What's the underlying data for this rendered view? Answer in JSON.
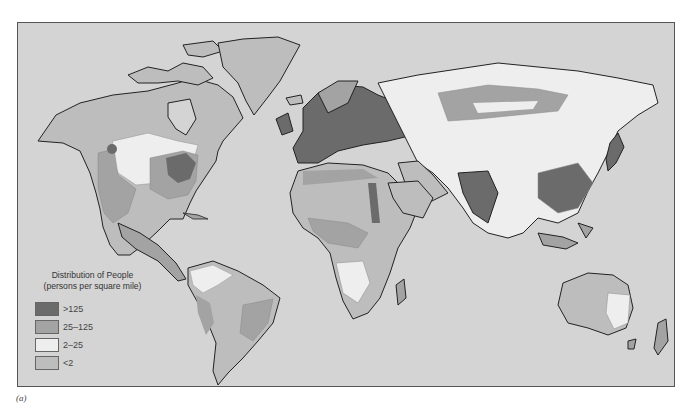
{
  "map": {
    "title": "Distribution of People",
    "subtitle": "(persons per square mile)",
    "colors": {
      "ocean": "#d4d4d4",
      "outline": "#222222"
    }
  },
  "legend": {
    "title": "Distribution of People",
    "subtitle": "(persons per square mile)",
    "items": [
      {
        "label": ">125",
        "color": "#6b6b6b"
      },
      {
        "label": "25–125",
        "color": "#a3a3a3"
      },
      {
        "label": "2–25",
        "color": "#eeeeee"
      },
      {
        "label": "<2",
        "color": "#bdbdbd"
      }
    ]
  },
  "caption": "(a)"
}
